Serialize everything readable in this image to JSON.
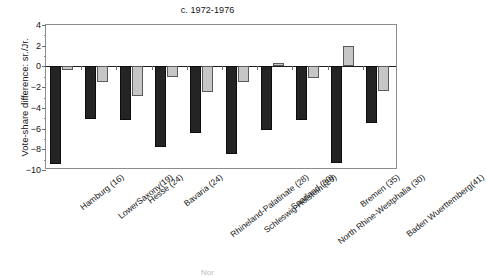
{
  "chart_data": {
    "type": "bar",
    "title": "c. 1972-1976",
    "xlabel": "",
    "ylabel": "Vote-share difference: sr./Jr.",
    "ylim": [
      -10,
      4
    ],
    "yticks": [
      4,
      2,
      0,
      -2,
      -4,
      -6,
      -8,
      -10
    ],
    "ytick_labels": [
      "4",
      "2",
      "0",
      "−2",
      "−4",
      "−6",
      "−8",
      "−10"
    ],
    "grid": false,
    "legend": "none",
    "categories": [
      "Hamburg (16)",
      "LowerSaxony(19)",
      "Hesse (24)",
      "Bavaria (24)",
      "Rhineland-Palatinate (28)",
      "Schleswig-Holstein (29)",
      "Saarland (30)",
      "North Rhine-Westphalia (30)",
      "Bremen (35)",
      "Baden Wuerttemberg(41)"
    ],
    "series": [
      {
        "name": "senior",
        "color": "#242424",
        "values": [
          -9.4,
          -5.1,
          -5.2,
          -7.8,
          -6.4,
          -8.5,
          -6.1,
          -5.2,
          -9.3,
          -5.5
        ]
      },
      {
        "name": "junior",
        "color": "#c6c6c6",
        "values": [
          -0.3,
          -1.5,
          -2.9,
          -1.0,
          -2.5,
          -1.5,
          0.3,
          -1.1,
          2.0,
          -2.4
        ]
      }
    ]
  },
  "footer": {
    "cropped_text": "Nor"
  }
}
